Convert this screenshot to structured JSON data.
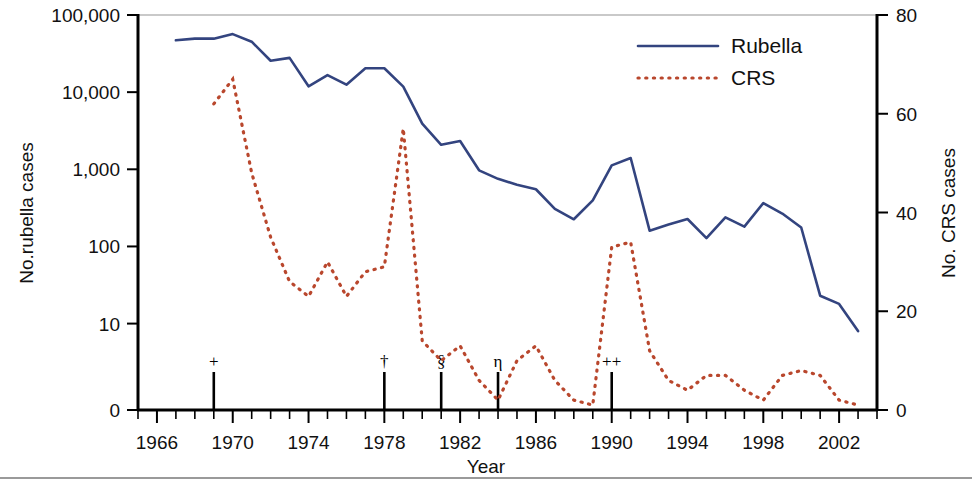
{
  "chart_data": {
    "type": "line",
    "title": "",
    "xlabel": "Year",
    "ylabel": "No.rubella cases",
    "y2label": "No. CRS cases",
    "x": [
      1966,
      1967,
      1968,
      1969,
      1970,
      1971,
      1972,
      1973,
      1974,
      1975,
      1976,
      1977,
      1978,
      1979,
      1980,
      1981,
      1982,
      1983,
      1984,
      1985,
      1986,
      1987,
      1988,
      1989,
      1990,
      1991,
      1992,
      1993,
      1994,
      1995,
      1996,
      1997,
      1998,
      1999,
      2000,
      2001,
      2002,
      2003,
      2004
    ],
    "xlim": [
      1965,
      2004
    ],
    "xticks": [
      1966,
      1970,
      1974,
      1978,
      1982,
      1986,
      1990,
      1994,
      1998,
      2002
    ],
    "xtick_labels": [
      "1966",
      "1970",
      "1974",
      "1978",
      "1982",
      "1986",
      "1990",
      "1994",
      "1998",
      "2002"
    ],
    "x_minor_tick_step": 1,
    "yscale": "log-with-zero-baseline",
    "yticks": [
      0,
      10,
      100,
      1000,
      10000,
      100000
    ],
    "ytick_labels": [
      "0",
      "10",
      "100",
      "1,000",
      "10,000",
      "100,000"
    ],
    "ylim": [
      0,
      100000
    ],
    "y2lim": [
      0,
      80
    ],
    "y2ticks": [
      0,
      20,
      40,
      60,
      80
    ],
    "y2tick_labels": [
      "0",
      "20",
      "40",
      "60",
      "80"
    ],
    "grid": false,
    "legend_position": "top-right",
    "series": [
      {
        "name": "Rubella",
        "axis": "left",
        "style": "solid",
        "color": "#33447f",
        "x": [
          1967,
          1968,
          1969,
          1970,
          1971,
          1972,
          1973,
          1974,
          1975,
          1976,
          1977,
          1978,
          1979,
          1980,
          1981,
          1982,
          1983,
          1984,
          1985,
          1986,
          1987,
          1988,
          1989,
          1990,
          1991,
          1992,
          1993,
          1994,
          1995,
          1996,
          1997,
          1998,
          1999,
          2000,
          2001,
          2002,
          2003
        ],
        "values": [
          46975,
          49371,
          49371,
          56552,
          45086,
          25507,
          27804,
          11917,
          16652,
          12491,
          20395,
          20395,
          11795,
          3904,
          2077,
          2325,
          970,
          752,
          630,
          551,
          306,
          225,
          396,
          1125,
          1401,
          160,
          192,
          227,
          128,
          238,
          181,
          364,
          267,
          176,
          23,
          18,
          8
        ]
      },
      {
        "name": "CRS",
        "axis": "right",
        "style": "dotted",
        "color": "#b9472d",
        "x": [
          1969,
          1970,
          1971,
          1972,
          1973,
          1974,
          1975,
          1976,
          1977,
          1978,
          1979,
          1980,
          1981,
          1982,
          1983,
          1984,
          1985,
          1986,
          1987,
          1988,
          1989,
          1990,
          1991,
          1992,
          1993,
          1994,
          1995,
          1996,
          1997,
          1998,
          1999,
          2000,
          2001,
          2002,
          2003
        ],
        "values": [
          62,
          67,
          48,
          35,
          26,
          23,
          30,
          23,
          28,
          29,
          57,
          14,
          10,
          13,
          6,
          2,
          10,
          13,
          6,
          2,
          1,
          33,
          34,
          12,
          6,
          4,
          7,
          7,
          4,
          2,
          7,
          8,
          7,
          2,
          1
        ]
      }
    ],
    "annotations": [
      {
        "symbol": "+",
        "year": 1969,
        "meaning": "marker-plus"
      },
      {
        "symbol": "†",
        "year": 1978,
        "meaning": "marker-dagger"
      },
      {
        "symbol": "§",
        "year": 1981,
        "meaning": "marker-section"
      },
      {
        "symbol": "η",
        "year": 1984,
        "meaning": "marker-eta"
      },
      {
        "symbol": "++",
        "year": 1990,
        "meaning": "marker-double-plus"
      }
    ]
  },
  "legend": {
    "items": [
      {
        "label": "Rubella",
        "color": "#33447f",
        "style": "solid"
      },
      {
        "label": "CRS",
        "color": "#b9472d",
        "style": "dotted"
      }
    ]
  },
  "axes": {
    "left_title": "No.rubella cases",
    "right_title": "No. CRS cases",
    "x_title": "Year"
  },
  "colors": {
    "rubella": "#33447f",
    "crs": "#b9472d",
    "axis": "#000000",
    "frame": "#c9c9c9",
    "background": "#ffffff"
  }
}
